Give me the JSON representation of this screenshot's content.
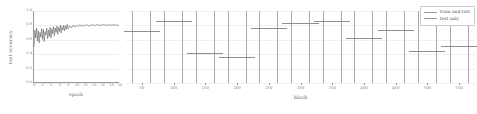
{
  "chart_data": [
    {
      "type": "line",
      "panel": "left",
      "title": "",
      "xlabel": "epoch",
      "ylabel": "test accuracy",
      "xlim": [
        0,
        20
      ],
      "ylim": [
        0.0,
        1.0
      ],
      "grid": true,
      "yticks": [
        "0.0",
        "0.2",
        "0.4",
        "0.6",
        "0.8",
        "1.0"
      ],
      "ytick_values": [
        0.0,
        0.2,
        0.4,
        0.6,
        0.8,
        1.0
      ],
      "xticks": [
        "0",
        "2",
        "4",
        "6",
        "8",
        "10",
        "12",
        "14",
        "16",
        "18",
        "20"
      ],
      "xtick_values": [
        0,
        2,
        4,
        6,
        8,
        10,
        12,
        14,
        16,
        18,
        20
      ],
      "series": [
        {
          "name": "test accuracy",
          "color": "#555555",
          "x": [
            0.0,
            0.2,
            0.4,
            0.6,
            0.8,
            1.0,
            1.2,
            1.4,
            1.6,
            1.8,
            2.0,
            2.2,
            2.4,
            2.6,
            2.8,
            3.0,
            3.2,
            3.4,
            3.6,
            3.8,
            4.0,
            4.2,
            4.4,
            4.6,
            4.8,
            5.0,
            5.2,
            5.4,
            5.6,
            5.8,
            6.0,
            6.2,
            6.4,
            6.6,
            6.8,
            7.0,
            7.2,
            7.4,
            7.6,
            7.8,
            8.0,
            8.4,
            8.8,
            9.2,
            9.6,
            10.0,
            10.4,
            10.8,
            11.2,
            11.6,
            12.0,
            12.4,
            12.8,
            13.2,
            13.6,
            14.0,
            14.4,
            14.8,
            15.2,
            15.6,
            16.0,
            16.4,
            16.8,
            17.2,
            17.6,
            18.0,
            18.4,
            18.8,
            19.2,
            19.6,
            20.0
          ],
          "y": [
            0.5,
            0.73,
            0.62,
            0.76,
            0.58,
            0.72,
            0.55,
            0.7,
            0.63,
            0.75,
            0.6,
            0.74,
            0.57,
            0.71,
            0.66,
            0.76,
            0.61,
            0.73,
            0.64,
            0.77,
            0.62,
            0.75,
            0.68,
            0.78,
            0.65,
            0.76,
            0.7,
            0.79,
            0.67,
            0.77,
            0.71,
            0.8,
            0.69,
            0.78,
            0.73,
            0.8,
            0.72,
            0.79,
            0.74,
            0.81,
            0.75,
            0.79,
            0.76,
            0.8,
            0.77,
            0.8,
            0.78,
            0.81,
            0.78,
            0.8,
            0.79,
            0.81,
            0.79,
            0.8,
            0.8,
            0.81,
            0.79,
            0.81,
            0.8,
            0.8,
            0.8,
            0.81,
            0.8,
            0.8,
            0.81,
            0.8,
            0.8,
            0.81,
            0.8,
            0.8,
            0.8
          ]
        }
      ]
    },
    {
      "type": "bar",
      "panel": "right",
      "title": "",
      "xlabel": "block",
      "ylabel": "",
      "ylim": [
        0.0,
        1.0
      ],
      "grid": true,
      "categories": [
        "50",
        "100",
        "150",
        "200",
        "250",
        "300",
        "350",
        "400",
        "450",
        "500",
        "550"
      ],
      "values": [
        0.72,
        0.86,
        0.41,
        0.36,
        0.76,
        0.84,
        0.86,
        0.62,
        0.73,
        0.45,
        0.52
      ],
      "legend_position": "upper right"
    }
  ],
  "left_plot": {
    "ylabel": "test accuracy",
    "xlabel": "epoch",
    "yticks": [
      "0.0",
      "0.2",
      "0.4",
      "0.6",
      "0.8",
      "1.0"
    ],
    "xticks": [
      "0",
      "2",
      "4",
      "6",
      "8",
      "10",
      "12",
      "14",
      "16",
      "18",
      "20"
    ]
  },
  "right_plot": {
    "xlabel": "block",
    "xticks": [
      "50",
      "100",
      "150",
      "200",
      "250",
      "300",
      "350",
      "400",
      "450",
      "500",
      "550"
    ]
  },
  "legend": {
    "items": [
      {
        "label": "train and test",
        "color": "#9a9a9a"
      },
      {
        "label": "test only",
        "color": "#9a9a9a"
      }
    ]
  }
}
